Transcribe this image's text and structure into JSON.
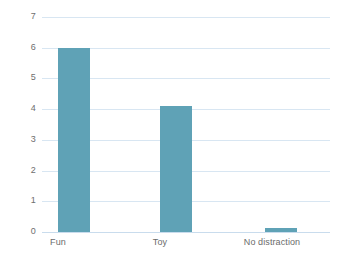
{
  "chart_data": {
    "type": "bar",
    "title": "",
    "subtitle": "",
    "xlabel": "",
    "ylabel": "",
    "categories": [
      "Fun",
      "Toy",
      "No distraction"
    ],
    "values": [
      6,
      4.1,
      0.13
    ],
    "series": [
      {
        "name": "",
        "values": [
          6,
          4.1,
          0.13
        ]
      }
    ],
    "ylim": [
      0,
      7
    ],
    "ytick_labels": [
      "0",
      "1",
      "2",
      "3",
      "4",
      "5",
      "6",
      "7"
    ],
    "ytick_values": [
      0,
      1,
      2,
      3,
      4,
      5,
      6,
      7
    ],
    "grid": true,
    "grid_axis": "y",
    "legend": false,
    "legend_position": "none",
    "colors": {
      "bar": "#5fa2b6",
      "gridline": "#d8e6f2",
      "baseline": "#c9dced",
      "tick_text": "#6e6e6e",
      "category_text": "#6b6b6b",
      "background": "#ffffff"
    }
  }
}
